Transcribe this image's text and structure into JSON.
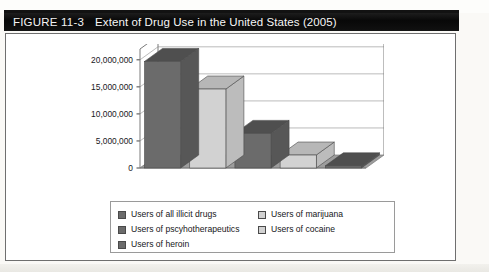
{
  "figure": {
    "number_label": "FIGURE 11-3",
    "title": "Extent of Drug Use in the United States (2005)"
  },
  "colors": {
    "dark_bar": "#6b6b6b",
    "dark_bar_top": "#4f4f4f",
    "dark_bar_side": "#575757",
    "light_bar": "#d2d2d2",
    "light_bar_top": "#b7b7b7",
    "light_bar_side": "#bcbcbc",
    "floor": "#9d9d9d",
    "axis": "#7a7a7a",
    "gridline": "#a9a9a9",
    "title_bar_bg": "#0b0b0b",
    "title_text": "#f5f5f5",
    "panel_border": "#6f6f6f"
  },
  "legend": {
    "items": [
      {
        "label": "Users of all illicit drugs",
        "swatch": "dark",
        "column": "left"
      },
      {
        "label": "Users of marijuana",
        "swatch": "light",
        "column": "right"
      },
      {
        "label": "Users of pscyhotherapeutics",
        "swatch": "dark",
        "column": "left"
      },
      {
        "label": "Users of cocaine",
        "swatch": "light",
        "column": "right"
      },
      {
        "label": "Users of heroin",
        "swatch": "dark",
        "column": "left"
      }
    ]
  },
  "chart_data": {
    "type": "bar",
    "title": "Extent of Drug Use in the United States (2005)",
    "xlabel": "",
    "ylabel": "",
    "ylim": [
      0,
      22000000
    ],
    "grid": true,
    "legend_position": "bottom",
    "three_d": true,
    "tick_labels": [
      "0",
      "5,000,000",
      "10,000,000",
      "15,000,000",
      "20,000,000"
    ],
    "ticks": [
      0,
      5000000,
      10000000,
      15000000,
      20000000
    ],
    "categories": [
      "Users of all illicit drugs",
      "Users of marijuana",
      "Users of pscyhotherapeutics",
      "Users of cocaine",
      "Users of heroin"
    ],
    "values": [
      19700000,
      14600000,
      6400000,
      2400000,
      400000
    ],
    "bar_shades": [
      "dark",
      "light",
      "dark",
      "light",
      "dark"
    ]
  }
}
